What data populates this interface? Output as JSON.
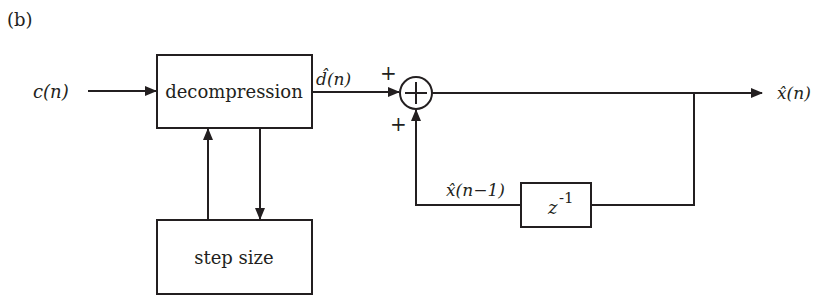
{
  "figure": {
    "panel_label": "(b)"
  },
  "blocks": {
    "decompression": {
      "label": "decompression"
    },
    "step_size": {
      "label": "step size"
    },
    "delay": {
      "base": "z",
      "exponent": "-1"
    },
    "summer": {
      "symbol": "+",
      "input_signs": [
        "+",
        "+"
      ]
    }
  },
  "signals": {
    "input": "c(n)",
    "decompressed_diff": "d̂(n)",
    "output": "x̂(n)",
    "delayed_output": "x̂(n−1)"
  },
  "colors": {
    "stroke": "#231f20",
    "background": "#ffffff"
  }
}
